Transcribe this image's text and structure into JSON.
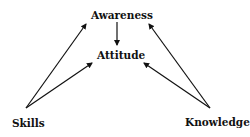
{
  "diagram": {
    "nodes": [
      {
        "id": "awareness",
        "label": "Awareness"
      },
      {
        "id": "attitude",
        "label": "Attitude"
      },
      {
        "id": "skills",
        "label": "Skills"
      },
      {
        "id": "knowledge",
        "label": "Knowledge"
      }
    ],
    "edges": [
      {
        "from": "awareness",
        "to": "attitude"
      },
      {
        "from": "skills",
        "to": "awareness"
      },
      {
        "from": "skills",
        "to": "attitude"
      },
      {
        "from": "knowledge",
        "to": "awareness"
      },
      {
        "from": "knowledge",
        "to": "attitude"
      }
    ],
    "colors": {
      "line": "#111111",
      "text": "#111111",
      "background": "#ffffff"
    }
  }
}
